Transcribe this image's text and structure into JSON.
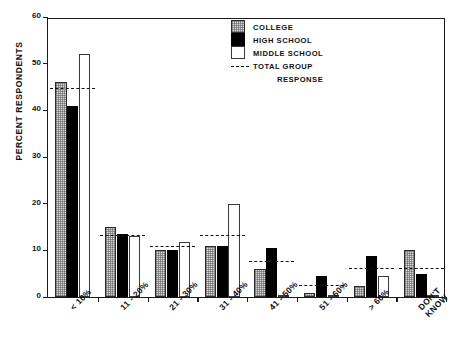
{
  "chart_data": {
    "type": "bar",
    "title": "",
    "xlabel": "",
    "ylabel": "PERCENT RESPONDENTS",
    "ylim": [
      0,
      60
    ],
    "yticks": [
      0,
      10,
      20,
      30,
      40,
      50,
      60
    ],
    "grid": false,
    "legend_position": "top-right",
    "categories": [
      "< 10%",
      "11 - 20%",
      "21 - 30%",
      "31 - 40%",
      "41 - 50%",
      "51 - 60%",
      "> 60%",
      "DON'T KNOW"
    ],
    "category_lines": [
      [
        "< 10%",
        ""
      ],
      [
        "11 - 20%",
        ""
      ],
      [
        "21 - 30%",
        ""
      ],
      [
        "31 - 40%",
        ""
      ],
      [
        "41 - 50%",
        ""
      ],
      [
        "51 - 60%",
        ""
      ],
      [
        "> 60%",
        ""
      ],
      [
        "DON'T",
        "KNOW"
      ]
    ],
    "series": [
      {
        "name": "COLLEGE",
        "values": [
          46,
          15,
          10,
          11,
          6,
          0.8,
          2.3,
          10
        ]
      },
      {
        "name": "HIGH SCHOOL",
        "values": [
          41,
          13.5,
          10,
          11,
          10.5,
          4.5,
          8.7,
          5
        ]
      },
      {
        "name": "MIDDLE SCHOOL",
        "values": [
          52,
          13,
          11.8,
          20,
          0.3,
          0,
          4.5,
          0.5
        ]
      }
    ],
    "total_group_response": {
      "name": "TOTAL GROUP RESPONSE",
      "values": [
        44.5,
        13,
        10.7,
        13,
        7.5,
        2.3,
        6,
        6
      ]
    },
    "annotations": []
  },
  "legend": {
    "items": [
      {
        "label": "COLLEGE",
        "swatch": "college"
      },
      {
        "label": "HIGH SCHOOL",
        "swatch": "highschool"
      },
      {
        "label": "MIDDLE SCHOOL",
        "swatch": "middleschool"
      }
    ],
    "total_label": "TOTAL GROUP",
    "total_label_2": "RESPONSE"
  }
}
